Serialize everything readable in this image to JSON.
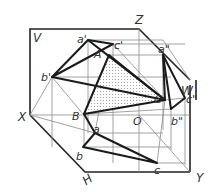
{
  "diagram": {
    "planes": {
      "V": "V",
      "H": "H",
      "W": "W"
    },
    "axes": {
      "X": "X",
      "Y": "Y",
      "Z": "Z",
      "O": "O"
    },
    "space_points": {
      "A": "A",
      "B": "B",
      "C": "C"
    },
    "front_projections": {
      "a": "a'",
      "b": "b'",
      "c": "c'"
    },
    "top_projections": {
      "a": "a",
      "b": "b",
      "c": "c"
    },
    "side_projections": {
      "a": "a\"",
      "b": "b\"",
      "c": "c\""
    },
    "colors": {
      "line": "#1a1a1a",
      "construction": "#8a8a8a",
      "fill": "#d9d9d9"
    }
  }
}
